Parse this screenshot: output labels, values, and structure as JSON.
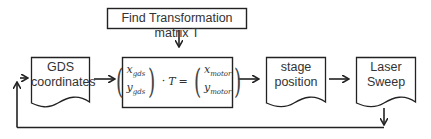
{
  "diagram": {
    "top_box": {
      "label": "Find Transformation matrix T"
    },
    "nodes": [
      {
        "id": "gds",
        "label_line1": "GDS",
        "label_line2": "coordinates",
        "shape": "document"
      },
      {
        "id": "transform",
        "shape": "rectangle",
        "formula": {
          "lhs_top": "x",
          "lhs_top_sub": "gds",
          "lhs_bottom": "y",
          "lhs_bottom_sub": "gds",
          "dot": "·",
          "matrix": "T",
          "equals": "=",
          "rhs_top": "x",
          "rhs_top_sub": "motor",
          "rhs_bottom": "y",
          "rhs_bottom_sub": "motor"
        }
      },
      {
        "id": "stage",
        "label_line1": "stage",
        "label_line2": "position",
        "shape": "document"
      },
      {
        "id": "laser",
        "label_line1": "Laser",
        "label_line2": "Sweep",
        "shape": "document"
      }
    ],
    "edges": [
      {
        "from": "top_box",
        "to": "transform"
      },
      {
        "from": "gds",
        "to": "transform"
      },
      {
        "from": "transform",
        "to": "stage"
      },
      {
        "from": "stage",
        "to": "laser"
      },
      {
        "from": "laser",
        "to": "gds",
        "type": "feedback-loop"
      }
    ],
    "colors": {
      "stroke": "#222222",
      "text": "#333333",
      "background": "#ffffff"
    }
  }
}
